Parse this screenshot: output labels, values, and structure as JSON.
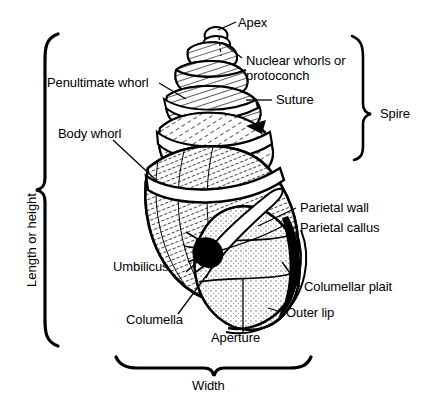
{
  "figure": {
    "background_color": "#ffffff",
    "ink_color": "#000000"
  },
  "labels": {
    "apex": "Apex",
    "nuclear_whorls_line1": "Nuclear whorls or",
    "nuclear_whorls_line2": "protoconch",
    "penultimate_whorl": "Penultimate whorl",
    "suture": "Suture",
    "body_whorl": "Body whorl",
    "spire": "Spire",
    "parietal_wall": "Parietal wall",
    "parietal_callus": "Parietal callus",
    "columellar_plait": "Columellar plait",
    "umbilicus": "Umbilicus",
    "columella": "Columella",
    "outer_lip": "Outer lip",
    "aperture": "Aperture",
    "length_or_height": "Length or height",
    "width": "Width"
  }
}
